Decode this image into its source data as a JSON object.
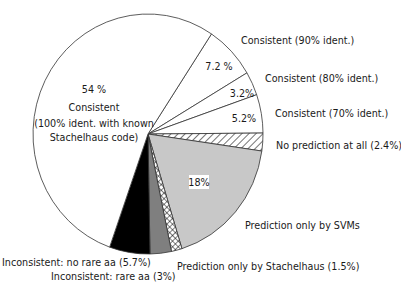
{
  "chart_data": {
    "type": "pie",
    "title": "",
    "center": [
      148,
      134
    ],
    "radius": [
      115,
      120
    ],
    "start_angle_deg": -56.5,
    "direction": "clockwise",
    "slices": [
      {
        "label": "Consistent (90% ident.)",
        "value": 7.2,
        "pct_text": "7.2 %",
        "fill": "#ffffff",
        "pattern": "none"
      },
      {
        "label": "Consistent (80% ident.)",
        "value": 3.2,
        "pct_text": "3.2%",
        "fill": "#ffffff",
        "pattern": "none"
      },
      {
        "label": "Consistent (70% ident.)",
        "value": 5.2,
        "pct_text": "5.2%",
        "fill": "#ffffff",
        "pattern": "none"
      },
      {
        "label": "No prediction at all (2.4%)",
        "value": 2.4,
        "pct_text": "",
        "fill": "#ffffff",
        "pattern": "diagonal-hatch"
      },
      {
        "label": "Prediction only by SVMs",
        "value": 18,
        "pct_text": "18%",
        "fill": "#c8c8c8",
        "pattern": "none"
      },
      {
        "label": "Prediction only by Stachelhaus (1.5%)",
        "value": 1.5,
        "pct_text": "",
        "fill": "#ffffff",
        "pattern": "crosshatch"
      },
      {
        "label": "Inconsistent: rare aa (3%)",
        "value": 3,
        "pct_text": "",
        "fill": "#7f7f7f",
        "pattern": "none"
      },
      {
        "label": "Inconsistent: no rare aa (5.7%)",
        "value": 5.7,
        "pct_text": "",
        "fill": "#000000",
        "pattern": "none"
      },
      {
        "label": "Consistent (100% ident. with known Stachelhaus code)",
        "value": 54,
        "pct_text": "54 %",
        "fill": "#ffffff",
        "pattern": "none"
      }
    ],
    "labels": {
      "big_slice_pct": "54 %",
      "big_slice_line1": "Consistent",
      "big_slice_line2": "(100% ident. with known",
      "big_slice_line3": "Stachelhaus code)",
      "pct_90": "7.2 %",
      "pct_80": "3.2%",
      "pct_70": "5.2%",
      "pct_svm": "18%",
      "ext_90": "Consistent (90% ident.)",
      "ext_80": "Consistent (80% ident.)",
      "ext_70": "Consistent (70% ident.)",
      "ext_noPred": "No prediction at all (2.4%)",
      "ext_svm": "Prediction only by SVMs",
      "ext_stach": "Prediction only by Stachelhaus (1.5%)",
      "ext_norare": "Inconsistent:  no rare aa (5.7%)",
      "ext_rare": "Inconsistent:  rare aa (3%)"
    },
    "legend": "none",
    "xlabel": "",
    "ylabel": ""
  }
}
